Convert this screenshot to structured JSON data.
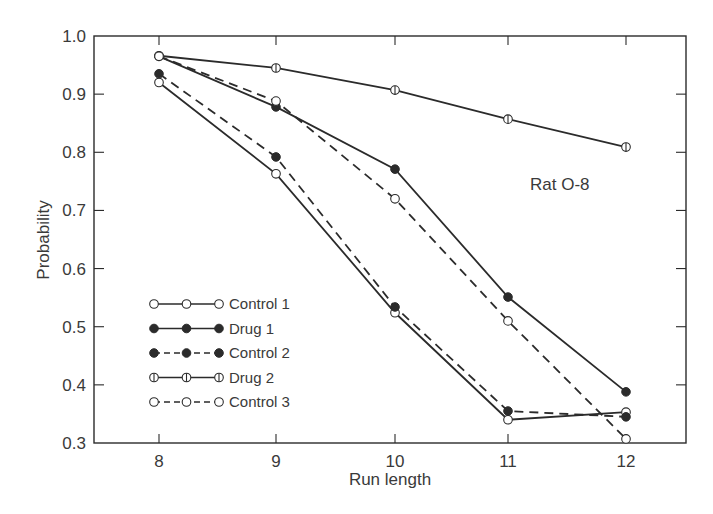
{
  "chart_data": {
    "type": "line",
    "title": "",
    "annotation": "Rat O-8",
    "xlabel": "Run length",
    "ylabel": "Probability",
    "x": [
      8,
      9,
      10,
      11,
      12
    ],
    "xticks": [
      "8",
      "9",
      "10",
      "11",
      "12"
    ],
    "yticks": [
      "1.0",
      "0.9",
      "0.8",
      "0.7",
      "0.6",
      "0.5",
      "0.4",
      "0.3"
    ],
    "ylim": [
      0.3,
      1.0
    ],
    "xlim": [
      7.35,
      12.5
    ],
    "grid": false,
    "legend_position": "lower-left inside",
    "series": [
      {
        "name": "Control 1",
        "marker": "open",
        "line": "solid",
        "values": [
          0.92,
          0.763,
          0.524,
          0.34,
          0.353
        ]
      },
      {
        "name": "Drug 1",
        "marker": "filled",
        "line": "solid",
        "values": [
          0.965,
          0.878,
          0.771,
          0.551,
          0.388
        ]
      },
      {
        "name": "Control 2",
        "marker": "filled",
        "line": "dashed",
        "values": [
          0.935,
          0.792,
          0.534,
          0.355,
          0.345
        ]
      },
      {
        "name": "Drug 2",
        "marker": "half",
        "line": "solid",
        "values": [
          0.966,
          0.945,
          0.907,
          0.857,
          0.809
        ]
      },
      {
        "name": "Control 3",
        "marker": "open",
        "line": "dashed",
        "values": [
          0.965,
          0.888,
          0.72,
          0.51,
          0.307
        ]
      }
    ]
  },
  "legend": {
    "items": [
      {
        "label": "Control 1"
      },
      {
        "label": "Drug 1"
      },
      {
        "label": "Control 2"
      },
      {
        "label": "Drug 2"
      },
      {
        "label": "Control 3"
      }
    ]
  },
  "colors": {
    "ink": "#2b2b2b",
    "background": "#ffffff"
  }
}
